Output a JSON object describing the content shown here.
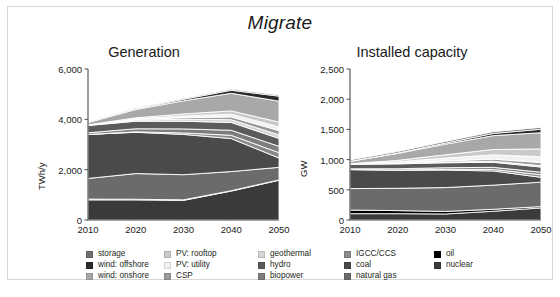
{
  "figure": {
    "title": "Migrate",
    "caption": ""
  },
  "legend": {
    "columns": [
      {
        "items": [
          {
            "label": "storage",
            "color": "#6f6f6f"
          },
          {
            "label": "wind: offshore",
            "color": "#2b2b2b"
          },
          {
            "label": "wind: onshore",
            "color": "#a8a8a8"
          }
        ]
      },
      {
        "items": [
          {
            "label": "PV: rooftop",
            "color": "#c9c9c9"
          },
          {
            "label": "PV: utility",
            "color": "#f2f2f2"
          },
          {
            "label": "CSP",
            "color": "#9a9a9a"
          }
        ]
      },
      {
        "items": [
          {
            "label": "geothermal",
            "color": "#d5d5d5"
          },
          {
            "label": "hydro",
            "color": "#5b5b5b"
          },
          {
            "label": "biopower",
            "color": "#7d7d7d"
          }
        ]
      },
      {
        "items": [
          {
            "label": "IGCC/CCS",
            "color": "#8a8a8a"
          },
          {
            "label": "coal",
            "color": "#4a4a4a"
          },
          {
            "label": "natural gas",
            "color": "#6b6b6b"
          }
        ]
      },
      {
        "items": [
          {
            "label": "oil",
            "color": "#000000"
          },
          {
            "label": "nuclear",
            "color": "#3a3a3a"
          }
        ]
      }
    ]
  },
  "chart_data": [
    {
      "id": "generation",
      "type": "area",
      "title": "Generation",
      "xlabel": "",
      "ylabel": "TWh/y",
      "x": [
        2010,
        2020,
        2030,
        2040,
        2050
      ],
      "xticks": [
        "2010",
        "2020",
        "2030",
        "2040",
        "2050"
      ],
      "yticks": [
        "0",
        "2,000",
        "4,000",
        "6,000"
      ],
      "ytickvals": [
        0,
        2000,
        4000,
        6000
      ],
      "ylim": [
        0,
        6000
      ],
      "xlim": [
        2010,
        2050
      ],
      "grid": false,
      "stacked": true,
      "legend_position": "below",
      "series": [
        {
          "name": "nuclear",
          "color": "#3a3a3a",
          "values": [
            800,
            800,
            780,
            1150,
            1580
          ]
        },
        {
          "name": "oil",
          "color": "#000000",
          "values": [
            30,
            25,
            20,
            15,
            12
          ]
        },
        {
          "name": "natural gas",
          "color": "#6b6b6b",
          "values": [
            820,
            1020,
            1000,
            760,
            500
          ]
        },
        {
          "name": "coal",
          "color": "#4a4a4a",
          "values": [
            1750,
            1640,
            1600,
            1310,
            370
          ]
        },
        {
          "name": "IGCC/CCS",
          "color": "#8a8a8a",
          "values": [
            0,
            20,
            60,
            130,
            215
          ]
        },
        {
          "name": "biopower",
          "color": "#7d7d7d",
          "values": [
            65,
            120,
            160,
            200,
            250
          ]
        },
        {
          "name": "hydro",
          "color": "#5b5b5b",
          "values": [
            290,
            300,
            305,
            310,
            315
          ]
        },
        {
          "name": "geothermal",
          "color": "#d5d5d5",
          "values": [
            18,
            45,
            80,
            110,
            140
          ]
        },
        {
          "name": "CSP",
          "color": "#9a9a9a",
          "values": [
            2,
            25,
            60,
            110,
            170
          ]
        },
        {
          "name": "PV: utility",
          "color": "#f2f2f2",
          "values": [
            2,
            30,
            70,
            110,
            150
          ]
        },
        {
          "name": "PV: rooftop",
          "color": "#c9c9c9",
          "values": [
            3,
            35,
            80,
            130,
            190
          ]
        },
        {
          "name": "wind: onshore",
          "color": "#a8a8a8",
          "values": [
            95,
            330,
            520,
            700,
            830
          ]
        },
        {
          "name": "wind: offshore",
          "color": "#2b2b2b",
          "values": [
            0,
            20,
            60,
            120,
            200
          ]
        },
        {
          "name": "storage",
          "color": "#6f6f6f",
          "values": [
            25,
            30,
            35,
            40,
            45
          ]
        }
      ]
    },
    {
      "id": "installed_capacity",
      "type": "area",
      "title": "Installed capacity",
      "xlabel": "",
      "ylabel": "GW",
      "x": [
        2010,
        2020,
        2030,
        2040,
        2050
      ],
      "xticks": [
        "2010",
        "2020",
        "2030",
        "2040",
        "2050"
      ],
      "yticks": [
        "0",
        "500",
        "1,000",
        "1,500",
        "2,000",
        "2,500"
      ],
      "ytickvals": [
        0,
        500,
        1000,
        1500,
        2000,
        2500
      ],
      "ylim": [
        0,
        2500
      ],
      "xlim": [
        2010,
        2050
      ],
      "grid": false,
      "stacked": true,
      "legend_position": "below",
      "series": [
        {
          "name": "nuclear",
          "color": "#3a3a3a",
          "values": [
            105,
            105,
            100,
            145,
            200
          ]
        },
        {
          "name": "oil",
          "color": "#000000",
          "values": [
            60,
            50,
            42,
            32,
            22
          ]
        },
        {
          "name": "natural gas",
          "color": "#6b6b6b",
          "values": [
            355,
            370,
            395,
            400,
            405
          ]
        },
        {
          "name": "coal",
          "color": "#4a4a4a",
          "values": [
            315,
            300,
            290,
            235,
            80
          ]
        },
        {
          "name": "IGCC/CCS",
          "color": "#8a8a8a",
          "values": [
            0,
            4,
            12,
            26,
            42
          ]
        },
        {
          "name": "biopower",
          "color": "#7d7d7d",
          "values": [
            12,
            20,
            27,
            34,
            42
          ]
        },
        {
          "name": "hydro",
          "color": "#5b5b5b",
          "values": [
            78,
            80,
            82,
            84,
            86
          ]
        },
        {
          "name": "geothermal",
          "color": "#d5d5d5",
          "values": [
            3,
            7,
            12,
            17,
            22
          ]
        },
        {
          "name": "CSP",
          "color": "#9a9a9a",
          "values": [
            1,
            8,
            19,
            34,
            52
          ]
        },
        {
          "name": "PV: utility",
          "color": "#f2f2f2",
          "values": [
            1,
            20,
            46,
            72,
            98
          ]
        },
        {
          "name": "PV: rooftop",
          "color": "#c9c9c9",
          "values": [
            2,
            24,
            55,
            88,
            128
          ]
        },
        {
          "name": "wind: onshore",
          "color": "#a8a8a8",
          "values": [
            40,
            115,
            175,
            230,
            268
          ]
        },
        {
          "name": "wind: offshore",
          "color": "#2b2b2b",
          "values": [
            0,
            6,
            18,
            36,
            58
          ]
        },
        {
          "name": "storage",
          "color": "#6f6f6f",
          "values": [
            22,
            24,
            26,
            28,
            30
          ]
        }
      ]
    }
  ]
}
